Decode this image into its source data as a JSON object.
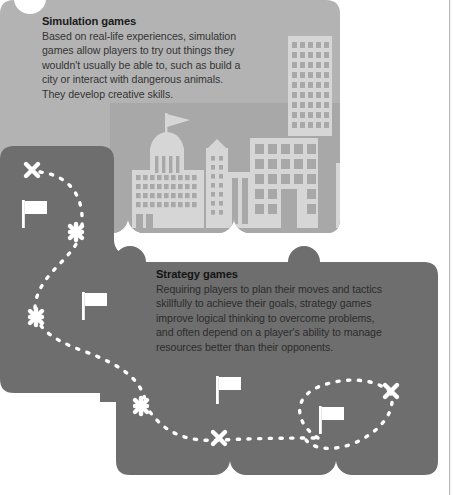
{
  "page": {
    "background": "#ffffff",
    "margin_rule_color": "#b9b9b9"
  },
  "palette": {
    "card_light": "#b3b3b3",
    "card_dark": "#6e6e6e",
    "skyline_band": "#a8a8a8",
    "building_fill": "#d6d6d6",
    "building_window": "#b0b0b0",
    "path_marker": "#ffffff",
    "heading_text": "#1a1a1a",
    "body_text": "#333333",
    "left_tab": "#5a5a5a"
  },
  "cards": [
    {
      "id": "simulation-card",
      "tone": "light",
      "heading": "Simulation games",
      "body_lines": [
        "Based on real-life experiences, simulation",
        "games allow players to try out things they",
        "wouldn't usually be able to, such as build a",
        "city or interact with dangerous animals.",
        "They develop creative skills."
      ]
    },
    {
      "id": "strategy-card",
      "tone": "dark",
      "heading": "Strategy games",
      "body_lines": [
        "Requiring players to plan their moves and tactics",
        "skillfully to achieve their goals, strategy games",
        "improve logical thinking to overcome problems,",
        "and often depend on a player's ability to manage",
        "resources better than their opponents."
      ]
    }
  ],
  "illustration": {
    "skyline_label": "city-skyline",
    "buildings": [
      {
        "name": "domed-capitol-with-flag",
        "x": 148,
        "y": 118
      },
      {
        "name": "narrow-tower-left",
        "x": 206,
        "y": 148
      },
      {
        "name": "striped-midrise",
        "x": 228,
        "y": 168
      },
      {
        "name": "grid-office-block",
        "x": 250,
        "y": 135
      },
      {
        "name": "tall-skyscraper",
        "x": 288,
        "y": 40
      },
      {
        "name": "low-wide-block",
        "x": 238,
        "y": 170
      },
      {
        "name": "apartment-right-a",
        "x": 338,
        "y": 160
      },
      {
        "name": "gabled-house-with-cloud",
        "x": 376,
        "y": 145
      },
      {
        "name": "apartment-right-b",
        "x": 408,
        "y": 150
      },
      {
        "name": "slim-tower-far-right",
        "x": 438,
        "y": 165
      }
    ],
    "cloud": {
      "name": "cloud-icon",
      "x": 390,
      "y": 145
    },
    "markers": [
      {
        "type": "x-mark",
        "x": 32,
        "y": 170
      },
      {
        "type": "flag",
        "x": 28,
        "y": 213
      },
      {
        "type": "x-mark",
        "x": 76,
        "y": 232
      },
      {
        "type": "x-mark",
        "x": 36,
        "y": 317
      },
      {
        "type": "flag",
        "x": 88,
        "y": 303
      },
      {
        "type": "x-mark",
        "x": 141,
        "y": 406
      },
      {
        "type": "flag",
        "x": 222,
        "y": 388
      },
      {
        "type": "x-mark",
        "x": 219,
        "y": 438
      },
      {
        "type": "flag",
        "x": 325,
        "y": 418
      },
      {
        "type": "x-mark",
        "x": 391,
        "y": 391
      }
    ],
    "path_style": "dashed-white-route"
  }
}
